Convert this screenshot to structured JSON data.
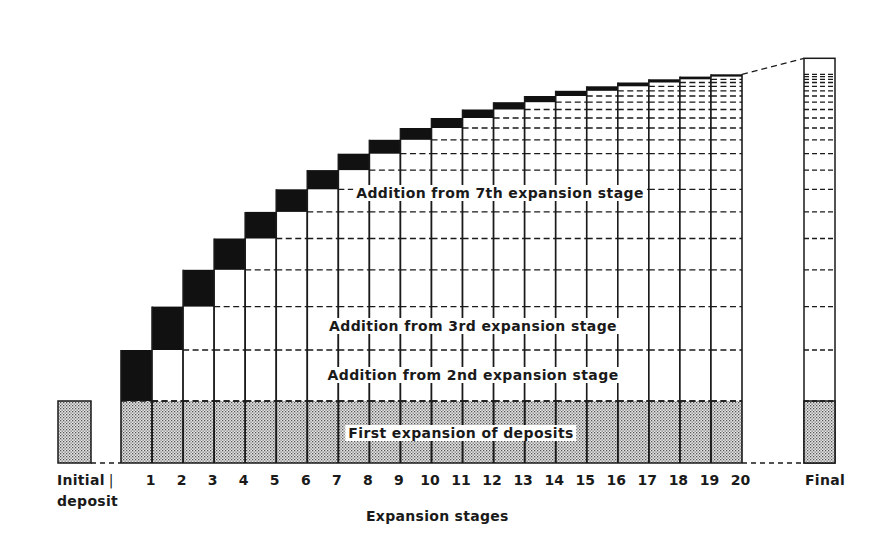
{
  "chart_data": {
    "type": "bar",
    "subtype": "stacked staircase (geometric deposit expansion)",
    "title": "",
    "xlabel": "Expansion stages",
    "ylabel": "",
    "categories": [
      "Initial deposit",
      "1",
      "2",
      "3",
      "4",
      "5",
      "6",
      "7",
      "8",
      "9",
      "10",
      "11",
      "12",
      "13",
      "14",
      "15",
      "16",
      "17",
      "18",
      "19",
      "20",
      "Final"
    ],
    "base_value": 62,
    "ratio": 0.85,
    "stage_additions_px": [
      51,
      43.4,
      36.8,
      31.3,
      26.6,
      22.6,
      19.2,
      16.4,
      13.9,
      11.8,
      10.0,
      8.5,
      7.3,
      6.2,
      5.2,
      4.5,
      3.8,
      3.2,
      2.7,
      2.3
    ],
    "annotations": [
      "First expansion of deposits",
      "Addition from 2nd expansion stage",
      "Addition from 3rd expansion stage",
      "Addition from 7th expansion stage"
    ],
    "grid": false,
    "legend": null
  },
  "labels": {
    "initial_line1": "Initial",
    "initial_line2": "deposit",
    "final": "Final",
    "axis_title": "Expansion stages",
    "first_expansion": "First expansion of deposits",
    "add_2nd": "Addition from 2nd expansion stage",
    "add_3rd": "Addition from 3rd expansion stage",
    "add_7th": "Addition from 7th expansion stage",
    "divider_mark": "|"
  },
  "stages": [
    "1",
    "2",
    "3",
    "4",
    "5",
    "6",
    "7",
    "8",
    "9",
    "10",
    "11",
    "12",
    "13",
    "14",
    "15",
    "16",
    "17",
    "18",
    "19",
    "20"
  ],
  "colors": {
    "ink": "#1a1a1a",
    "stipple_bg": "#d9d9d9",
    "background": "#ffffff"
  }
}
